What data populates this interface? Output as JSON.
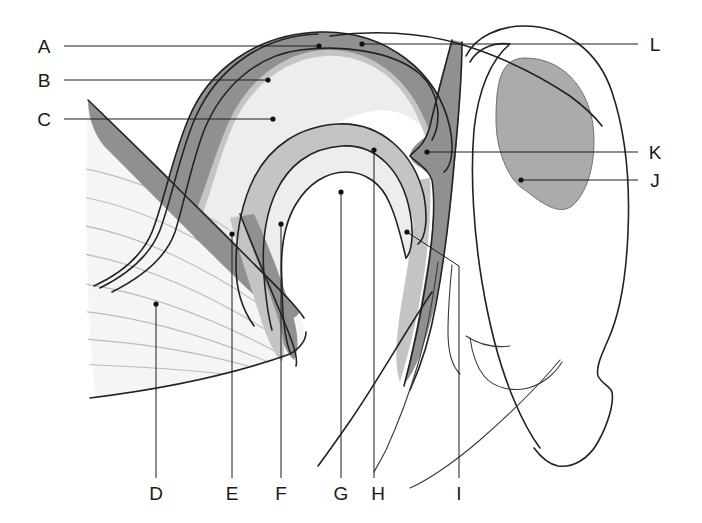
{
  "figure": {
    "type": "line-diagram",
    "background_color": "#ffffff",
    "width": 702,
    "height": 523
  },
  "palette": {
    "band_dark_gray": "#8e9092",
    "band_mid_gray": "#c2c4c5",
    "interior_light_gray": "#eceded",
    "muscle_fill": "#f3f4f4",
    "muscle_striation": "#b9bcbd",
    "skull_fill": "#a9abac",
    "outline": "#222222",
    "leader_line": "#1d1d1d",
    "label_text": "#1a1a1a"
  },
  "labels": [
    {
      "id": "A",
      "text": "A",
      "text_x": 44,
      "text_y": 52,
      "side": "left",
      "target_x": 319,
      "target_y": 47
    },
    {
      "id": "B",
      "text": "B",
      "text_x": 44,
      "text_y": 85,
      "side": "left",
      "target_x": 268,
      "target_y": 80
    },
    {
      "id": "C",
      "text": "C",
      "text_x": 44,
      "text_y": 124,
      "side": "left",
      "target_x": 273,
      "target_y": 119
    },
    {
      "id": "D",
      "text": "D",
      "text_x": 152,
      "text_y": 498,
      "side": "bottom",
      "target_x": 156,
      "target_y": 304
    },
    {
      "id": "E",
      "text": "E",
      "text_x": 228,
      "text_y": 498,
      "side": "bottom",
      "target_x": 232,
      "target_y": 234
    },
    {
      "id": "F",
      "text": "F",
      "text_x": 278,
      "text_y": 498,
      "side": "bottom",
      "target_x": 281,
      "target_y": 224
    },
    {
      "id": "G",
      "text": "G",
      "text_x": 338,
      "text_y": 498,
      "side": "bottom",
      "target_x": 341,
      "target_y": 192
    },
    {
      "id": "H",
      "text": "H",
      "text_x": 375,
      "text_y": 498,
      "side": "bottom",
      "target_x": 374,
      "target_y": 150
    },
    {
      "id": "I",
      "text": "I",
      "text_x": 458,
      "text_y": 498,
      "side": "bottom",
      "target_x": 407,
      "target_y": 232
    },
    {
      "id": "J",
      "text": "J",
      "text_x": 652,
      "text_y": 185,
      "side": "right",
      "target_x": 521,
      "target_y": 180
    },
    {
      "id": "K",
      "text": "K",
      "text_x": 652,
      "text_y": 157,
      "side": "right",
      "target_x": 427,
      "target_y": 152
    },
    {
      "id": "L",
      "text": "L",
      "text_x": 652,
      "text_y": 50,
      "side": "right",
      "target_x": 362,
      "target_y": 44
    }
  ],
  "label_ids": {
    "a": "A",
    "b": "B",
    "c": "C",
    "d": "D",
    "e": "E",
    "f": "F",
    "g": "G",
    "h": "H",
    "i": "I",
    "j": "J",
    "k": "K",
    "l": "L"
  },
  "regions": [
    {
      "name": "outer-dark-band",
      "label_ref": "A",
      "shade": "dark-gray"
    },
    {
      "name": "middle-gray-band",
      "label_ref": "B",
      "shade": "mid-gray"
    },
    {
      "name": "inner-light-cavity",
      "label_ref": "C",
      "shade": "light-gray"
    },
    {
      "name": "striated-muscle-mass",
      "label_ref": "D",
      "shade": "very-light-gray-with-striations"
    },
    {
      "name": "muscle-fascia-edge",
      "label_ref": "E",
      "shade": "dark-gray"
    },
    {
      "name": "lower-band-junction",
      "label_ref": "F",
      "shade": "dark-gray"
    },
    {
      "name": "central-cavity",
      "label_ref": "G",
      "shade": "white"
    },
    {
      "name": "inner-fold-band",
      "label_ref": "H",
      "shade": "mid-gray"
    },
    {
      "name": "lower-contour-line",
      "label_ref": "I",
      "shade": "outline"
    },
    {
      "name": "shaded-oval-body",
      "label_ref": "J",
      "shade": "mid-dark-gray"
    },
    {
      "name": "band-bulge-node",
      "label_ref": "K",
      "shade": "dark-gray"
    },
    {
      "name": "upper-outer-contour",
      "label_ref": "L",
      "shade": "outline"
    }
  ]
}
